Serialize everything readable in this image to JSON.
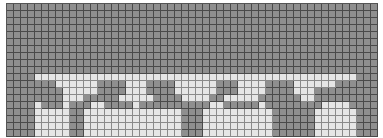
{
  "grid": {
    "columns": 53,
    "rows": 19,
    "cell_px": 7,
    "colors": {
      "dark": "#8f8f8f",
      "light": "#e6e6e6",
      "line": "#4a4a4a"
    },
    "legend": {
      "D": "dark",
      "L": "light"
    },
    "cells": [
      "DDDDDDDDDDDDDDDDDDDDDDDDDDDDDDDDDDDDDDDDDDDDDDDDDDDDD",
      "DDDDDDDDDDDDDDDDDDDDDDDDDDDDDDDDDDDDDDDDDDDDDDDDDDDDD",
      "DDDDDDDDDDDDDDDDDDDDDDDDDDDDDDDDDDDDDDDDDDDDDDDDDDDDD",
      "DDDDDDDDDDDDDDDDDDDDDDDDDDDDDDDDDDDDDDDDDDDDDDDDDDDDD",
      "DDDDDDDDDDDDDDDDDDDDDDDDDDDDDDDDDDDDDDDDDDDDDDDDDDDDD",
      "DDDDDDDDDDDDDDDDDDDDDDDDDDDDDDDDDDDDDDDDDDDDDDDDDDDDD",
      "DDDDDDDDDDDDDDDDDDDDDDDDDDDDDDDDDDDDDDDDDDDDDDDDDDDDD",
      "DDDDDDDDDDDDDDDDDDDDDDDDDDDDDDDDDDDDDDDDDDDDDDDDDDDDD",
      "DDDDDDDDDDDDDDDDDDDDDDDDDDDDDDDDDDDDDDDDDDDDDDDDDDDDD",
      "DDDDDDDDDDDDDDDDDDDDDDDDDDDDDDDDDDDDDDDDDDDDDDDDDDDDD",
      "DDDDLLLLLLLLLLLLLLLLLLLLLLLLLLLLLLLLLLLLLLLLLLLLLLDDD",
      "DDDDDDDLLLLLLDDDDLLLDDDDLLLLLLDDDLLLLDDDDLLLLLLDDDDDD",
      "DDDDDDDDLLLLLDDDDLLLDDDDLLLLLLDDDLLLLDDDDLLLDDDDDDDDD",
      "DDDDDDDDLLLDDDDDLLLLLDDDDLLLLDDLLLLLDDDDDDLLDDDDDDDDD",
      "DDDDLDDDLDDDLLDDDDLDDDDDDDDDDLLDDDDDLDDDDDDDDLLLLDDDD",
      "DDDDLLLLLDDLLLLLLLLLLLLLLDDDLLLLLLLLLLDDDDDDLLLLLLDDD",
      "DDDDLLLLLDDLLLLLLLLLLLLLLDDDLLLLLLLLLLDDDDDDLLLLLLDDD",
      "DDDDLLLLLDDLLLLLLLLLLLLLLDDDLLLLLLLLLLDDDDDDLLLLLLDDD",
      "DDDDLLLLLDDLLLLLLLLLLLLLLDDDLLLLLLLLLLDDDDDDLLLLLLDDD"
    ]
  }
}
